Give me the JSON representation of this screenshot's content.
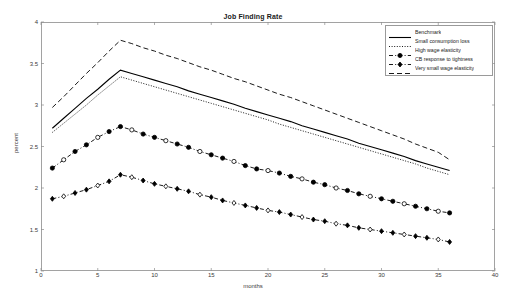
{
  "chart_data": {
    "type": "line",
    "title": "Job Finding Rate",
    "xlabel": "months",
    "ylabel": "percent",
    "xlim": [
      0,
      40
    ],
    "ylim": [
      1,
      4
    ],
    "xticks": [
      0,
      5,
      10,
      15,
      20,
      25,
      30,
      35,
      40
    ],
    "yticks": [
      1,
      1.5,
      2,
      2.5,
      3,
      3.5,
      4
    ],
    "grid": false,
    "legend_position": "top-right",
    "x": [
      1,
      2,
      3,
      4,
      5,
      6,
      7,
      8,
      9,
      10,
      11,
      12,
      13,
      14,
      15,
      16,
      17,
      18,
      19,
      20,
      21,
      22,
      23,
      24,
      25,
      26,
      27,
      28,
      29,
      30,
      31,
      32,
      33,
      34,
      35,
      36
    ],
    "series": [
      {
        "name": "Benchmark",
        "style": "solid",
        "marker": "none",
        "color": "#000000",
        "values": [
          2.72,
          2.84,
          2.96,
          3.08,
          3.19,
          3.31,
          3.42,
          3.38,
          3.34,
          3.3,
          3.26,
          3.22,
          3.17,
          3.13,
          3.09,
          3.05,
          3.01,
          2.96,
          2.92,
          2.88,
          2.84,
          2.8,
          2.75,
          2.71,
          2.67,
          2.63,
          2.59,
          2.54,
          2.5,
          2.46,
          2.42,
          2.38,
          2.33,
          2.29,
          2.25,
          2.21
        ]
      },
      {
        "name": "Small consumption loss",
        "style": "dotted",
        "marker": "none",
        "color": "#000000",
        "values": [
          2.67,
          2.78,
          2.89,
          3.0,
          3.12,
          3.23,
          3.34,
          3.3,
          3.26,
          3.22,
          3.18,
          3.14,
          3.1,
          3.06,
          3.02,
          2.98,
          2.94,
          2.9,
          2.86,
          2.82,
          2.77,
          2.73,
          2.69,
          2.65,
          2.61,
          2.57,
          2.53,
          2.49,
          2.45,
          2.41,
          2.37,
          2.33,
          2.29,
          2.24,
          2.2,
          2.16
        ]
      },
      {
        "name": "High wage elasticity",
        "style": "dashdot",
        "marker": "circle",
        "color": "#000000",
        "values": [
          2.24,
          2.34,
          2.44,
          2.52,
          2.61,
          2.68,
          2.74,
          2.7,
          2.65,
          2.61,
          2.57,
          2.53,
          2.49,
          2.44,
          2.4,
          2.36,
          2.32,
          2.27,
          2.23,
          2.21,
          2.18,
          2.14,
          2.11,
          2.07,
          2.04,
          2.0,
          1.97,
          1.93,
          1.9,
          1.87,
          1.84,
          1.81,
          1.78,
          1.75,
          1.72,
          1.7
        ]
      },
      {
        "name": "CB response to tightness",
        "style": "dashdot",
        "marker": "diamond",
        "color": "#000000",
        "values": [
          1.87,
          1.9,
          1.94,
          1.98,
          2.03,
          2.08,
          2.16,
          2.13,
          2.09,
          2.05,
          2.02,
          1.99,
          1.96,
          1.92,
          1.89,
          1.85,
          1.82,
          1.79,
          1.76,
          1.73,
          1.71,
          1.68,
          1.65,
          1.62,
          1.6,
          1.57,
          1.55,
          1.52,
          1.5,
          1.48,
          1.46,
          1.44,
          1.42,
          1.4,
          1.38,
          1.35
        ]
      },
      {
        "name": "Very small wage elasticity",
        "style": "dashed",
        "marker": "none",
        "color": "#000000",
        "values": [
          2.97,
          3.1,
          3.24,
          3.38,
          3.51,
          3.65,
          3.78,
          3.74,
          3.69,
          3.65,
          3.6,
          3.56,
          3.51,
          3.46,
          3.42,
          3.37,
          3.32,
          3.28,
          3.23,
          3.18,
          3.13,
          3.09,
          3.04,
          2.99,
          2.94,
          2.89,
          2.84,
          2.79,
          2.74,
          2.69,
          2.64,
          2.59,
          2.53,
          2.48,
          2.43,
          2.34
        ]
      }
    ]
  },
  "axes": {
    "frame_color": "#8c8c8c",
    "text_color": "#3a3a3a"
  }
}
